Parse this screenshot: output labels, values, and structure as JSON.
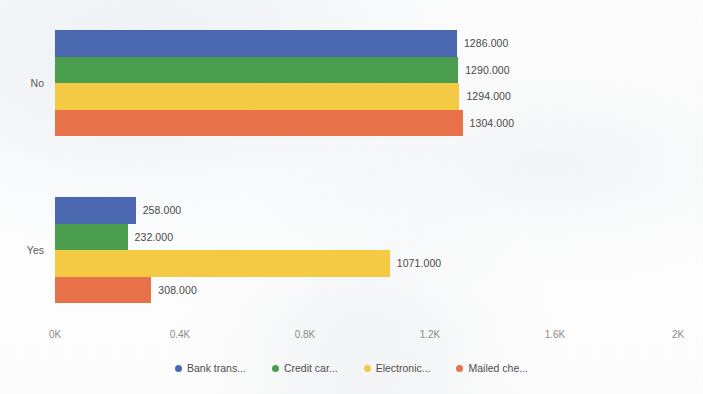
{
  "chart_data": {
    "type": "bar",
    "orientation": "horizontal",
    "title": "",
    "xlabel": "",
    "ylabel": "",
    "categories": [
      "No",
      "Yes"
    ],
    "series": [
      {
        "name": "Bank trans...",
        "color": "#4a69b0",
        "values": [
          1286,
          258
        ],
        "labels": [
          "1286.000",
          "258.000"
        ]
      },
      {
        "name": "Credit car...",
        "color": "#4a9e4e",
        "values": [
          1290,
          232
        ],
        "labels": [
          "1290.000",
          "232.000"
        ]
      },
      {
        "name": "Electronic...",
        "color": "#f5cb45",
        "values": [
          1294,
          1071
        ],
        "labels": [
          "1294.000",
          "1071.000"
        ]
      },
      {
        "name": "Mailed che...",
        "color": "#e8734a",
        "values": [
          1304,
          308
        ],
        "labels": [
          "1304.000",
          "308.000"
        ]
      }
    ],
    "xlim": [
      0,
      2000
    ],
    "xticks": [
      0,
      400,
      800,
      1200,
      1600,
      2000
    ],
    "xtick_labels": [
      "0K",
      "0.4K",
      "0.8K",
      "1.2K",
      "1.6K",
      "2K"
    ],
    "grid": false,
    "legend_position": "bottom"
  },
  "axis": {
    "ticks": [
      {
        "label": "0K",
        "pos_px": 55
      },
      {
        "label": "0.4K",
        "pos_px": 180
      },
      {
        "label": "0.8K",
        "pos_px": 305
      },
      {
        "label": "1.2K",
        "pos_px": 430
      },
      {
        "label": "1.6K",
        "pos_px": 555
      },
      {
        "label": "2K",
        "pos_px": 678
      }
    ]
  },
  "category_labels": {
    "no": "No",
    "yes": "Yes"
  },
  "legend": {
    "items": [
      {
        "label": "Bank trans...",
        "color": "#4a69b0"
      },
      {
        "label": "Credit car...",
        "color": "#4a9e4e"
      },
      {
        "label": "Electronic...",
        "color": "#f5cb45"
      },
      {
        "label": "Mailed che...",
        "color": "#e8734a"
      }
    ]
  }
}
